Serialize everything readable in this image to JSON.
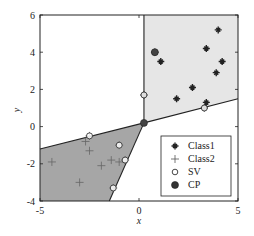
{
  "chart_data": {
    "type": "scatter",
    "title": "",
    "xlabel": "x",
    "ylabel": "y",
    "xlim": [
      -5,
      5
    ],
    "ylim": [
      -4,
      6
    ],
    "xticks": [
      -5,
      0,
      5
    ],
    "yticks": [
      -4,
      -2,
      0,
      2,
      4,
      6
    ],
    "grid": false,
    "legend_position": "lower right",
    "legend": [
      "Class1",
      "Class2",
      "SV",
      "CP"
    ],
    "series": [
      {
        "name": "Class1",
        "marker": "star",
        "points": [
          [
            4.0,
            5.2
          ],
          [
            3.4,
            4.2
          ],
          [
            4.2,
            3.5
          ],
          [
            1.1,
            3.5
          ],
          [
            3.9,
            2.9
          ],
          [
            2.7,
            2.1
          ],
          [
            1.9,
            1.5
          ],
          [
            3.4,
            1.3
          ],
          [
            3.3,
            1.0
          ],
          [
            0.8,
            4.0
          ],
          [
            0.25,
            1.7
          ]
        ]
      },
      {
        "name": "Class2",
        "marker": "plus",
        "points": [
          [
            -4.4,
            -1.9
          ],
          [
            -3.0,
            -3.0
          ],
          [
            -2.7,
            -0.8
          ],
          [
            -2.5,
            -1.3
          ],
          [
            -1.9,
            -2.1
          ],
          [
            -1.4,
            -1.8
          ],
          [
            -1.0,
            -1.9
          ],
          [
            -2.5,
            -0.5
          ],
          [
            -1.0,
            -1.0
          ],
          [
            -0.7,
            -1.8
          ],
          [
            -1.3,
            -3.3
          ]
        ]
      },
      {
        "name": "SV",
        "marker": "open-circle",
        "points": [
          [
            0.25,
            1.7
          ],
          [
            0.8,
            4.0
          ],
          [
            3.3,
            1.0
          ],
          [
            -2.5,
            -0.5
          ],
          [
            -1.0,
            -1.0
          ],
          [
            -0.7,
            -1.8
          ],
          [
            -1.3,
            -3.3
          ]
        ]
      },
      {
        "name": "CP",
        "marker": "filled-circle",
        "points": [
          [
            0.8,
            4.0
          ],
          [
            0.25,
            0.2
          ]
        ]
      }
    ],
    "regions": [
      {
        "name": "Class1 region",
        "fill": "#e6e6e6",
        "polygon": [
          [
            0.25,
            0.2
          ],
          [
            0.25,
            6
          ],
          [
            5,
            6
          ],
          [
            5,
            1.5
          ]
        ]
      },
      {
        "name": "Class2 region",
        "fill": "#a6a6a6",
        "polygon": [
          [
            -5,
            -1.2
          ],
          [
            0.25,
            0.2
          ],
          [
            -1.5,
            -4
          ],
          [
            -5,
            -4
          ]
        ]
      }
    ],
    "boundaries": [
      [
        [
          -5,
          -1.2
        ],
        [
          0.25,
          0.2
        ],
        [
          5,
          1.5
        ]
      ],
      [
        [
          0.25,
          0.2
        ],
        [
          0.25,
          6
        ]
      ],
      [
        [
          0.25,
          0.2
        ],
        [
          -1.5,
          -4
        ]
      ]
    ]
  },
  "axes": {
    "xlabel": "x",
    "ylabel": "y",
    "xticks": [
      "-5",
      "0",
      "5"
    ],
    "yticks": [
      "6",
      "4",
      "2",
      "0",
      "-2",
      "-4"
    ]
  },
  "legend": {
    "items": [
      "Class1",
      "Class2",
      "SV",
      "CP"
    ]
  }
}
